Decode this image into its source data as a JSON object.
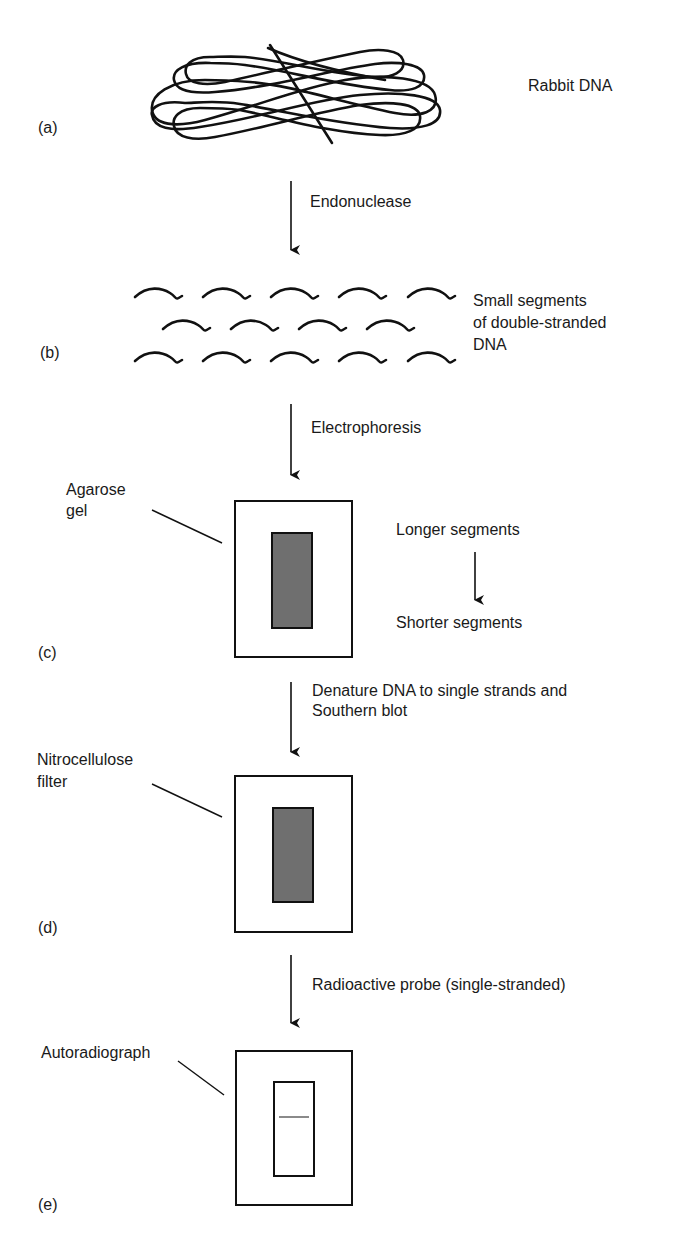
{
  "figure": {
    "colors": {
      "ink": "#111111",
      "gel_fill": "#6f6f6f",
      "band": "#8a8a8a",
      "background": "#ffffff"
    },
    "panels": [
      {
        "id": "a",
        "letter": "(a)",
        "label": "Rabbit DNA",
        "graphic": "tangled-dna-loops"
      },
      {
        "id": "b",
        "letter": "(b)",
        "label_lines": [
          "Small segments",
          "of double-stranded",
          "DNA"
        ],
        "graphic": "dna-fragments",
        "fragment_rows": [
          5,
          4,
          5
        ]
      },
      {
        "id": "c",
        "letter": "(c)",
        "callout": [
          "Agarose",
          "gel"
        ],
        "graphic": "gel-with-filled-lane",
        "side_note": {
          "top": "Longer segments",
          "bottom": "Shorter segments"
        }
      },
      {
        "id": "d",
        "letter": "(d)",
        "callout": [
          "Nitrocellulose",
          "filter"
        ],
        "graphic": "filter-with-filled-lane"
      },
      {
        "id": "e",
        "letter": "(e)",
        "callout": [
          "Autoradiograph"
        ],
        "graphic": "autoradiograph-single-band"
      }
    ],
    "steps": [
      {
        "from": "a",
        "to": "b",
        "lines": [
          "Endonuclease"
        ]
      },
      {
        "from": "b",
        "to": "c",
        "lines": [
          "Electrophoresis"
        ]
      },
      {
        "from": "c",
        "to": "d",
        "lines": [
          "Denature DNA to single strands and",
          "Southern blot"
        ]
      },
      {
        "from": "d",
        "to": "e",
        "lines": [
          "Radioactive probe (single-stranded)"
        ]
      }
    ]
  }
}
